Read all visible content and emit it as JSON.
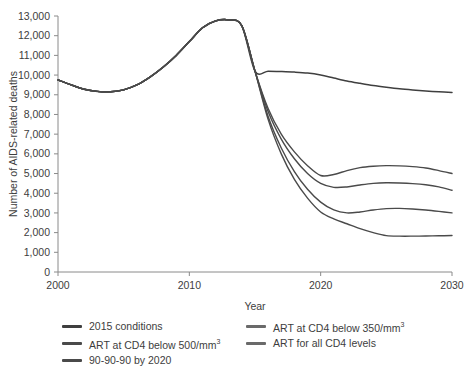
{
  "chart_data": {
    "type": "line",
    "title": "",
    "xlabel": "Year",
    "ylabel": "Number of AIDS-related deaths",
    "xlim": [
      2000,
      2030
    ],
    "ylim": [
      0,
      13000
    ],
    "grid": false,
    "legend_position": "bottom",
    "x_ticks": [
      "2000",
      "2010",
      "2020",
      "2030"
    ],
    "x_tick_values": [
      2000,
      2010,
      2020,
      2030
    ],
    "y_ticks": [
      "0",
      "1,000",
      "2,000",
      "3,000",
      "4,000",
      "5,000",
      "6,000",
      "7,000",
      "8,000",
      "9,000",
      "10,000",
      "11,000",
      "12,000",
      "13,000"
    ],
    "y_tick_values": [
      0,
      1000,
      2000,
      3000,
      4000,
      5000,
      6000,
      7000,
      8000,
      9000,
      10000,
      11000,
      12000,
      13000
    ],
    "x": [
      2000,
      2001,
      2002,
      2003,
      2004,
      2005,
      2006,
      2007,
      2008,
      2009,
      2010,
      2011,
      2012,
      2013,
      2014,
      2015,
      2016,
      2017,
      2018,
      2019,
      2020,
      2021,
      2022,
      2023,
      2024,
      2025,
      2026,
      2027,
      2028,
      2029,
      2030
    ],
    "series": [
      {
        "name": "2015 conditions",
        "color": "#3f3f3f",
        "values": [
          9750,
          9500,
          9280,
          9170,
          9150,
          9250,
          9500,
          9900,
          10400,
          11000,
          11700,
          12400,
          12750,
          12800,
          12500,
          10200,
          10200,
          10180,
          10150,
          10100,
          10000,
          9850,
          9700,
          9580,
          9470,
          9380,
          9300,
          9240,
          9190,
          9150,
          9120
        ]
      },
      {
        "name": "ART at CD4 below 500/mm³",
        "color": "#4a4a4a",
        "values": [
          9750,
          9500,
          9280,
          9170,
          9150,
          9250,
          9500,
          9900,
          10400,
          11000,
          11700,
          12400,
          12750,
          12800,
          12500,
          10200,
          8300,
          7000,
          6100,
          5400,
          4900,
          4950,
          5150,
          5300,
          5370,
          5400,
          5390,
          5350,
          5280,
          5150,
          5000
        ]
      },
      {
        "name": "ART at CD4 below 350/mm³",
        "color": "#4a4a4a",
        "values": [
          9750,
          9500,
          9280,
          9170,
          9150,
          9250,
          9500,
          9900,
          10400,
          11000,
          11700,
          12400,
          12750,
          12800,
          12500,
          10200,
          8150,
          6750,
          5750,
          5000,
          4500,
          4300,
          4320,
          4420,
          4500,
          4530,
          4520,
          4490,
          4430,
          4320,
          4150
        ]
      },
      {
        "name": "ART for all CD4 levels",
        "color": "#4a4a4a",
        "values": [
          9750,
          9500,
          9280,
          9170,
          9150,
          9250,
          9500,
          9900,
          10400,
          11000,
          11700,
          12400,
          12750,
          12800,
          12500,
          10200,
          7900,
          6300,
          5100,
          4200,
          3550,
          3150,
          3000,
          3050,
          3150,
          3220,
          3230,
          3200,
          3150,
          3080,
          3000
        ]
      },
      {
        "name": "90-90-90 by 2020",
        "color": "#4a4a4a",
        "values": [
          9750,
          9500,
          9280,
          9170,
          9150,
          9250,
          9500,
          9900,
          10400,
          11000,
          11700,
          12400,
          12750,
          12800,
          12500,
          10200,
          7750,
          6000,
          4700,
          3750,
          3050,
          2700,
          2450,
          2200,
          2000,
          1850,
          1820,
          1820,
          1830,
          1840,
          1850
        ]
      }
    ]
  },
  "legend": {
    "entries": [
      {
        "label": "2015 conditions",
        "color": "#3f3f3f",
        "sup": ""
      },
      {
        "label": "ART at CD4 below 350/mm",
        "color": "#6a6a6a",
        "sup": "3"
      },
      {
        "label": "ART at CD4 below 500/mm",
        "color": "#4a4a4a",
        "sup": "3"
      },
      {
        "label": "ART for all CD4 levels",
        "color": "#6a6a6a",
        "sup": ""
      },
      {
        "label": "90-90-90 by 2020",
        "color": "#4a4a4a",
        "sup": ""
      }
    ]
  },
  "colors": {
    "background": "#ffffff",
    "axis": "#8a8a8a",
    "text": "#3d3d3d",
    "line": "#454545"
  }
}
